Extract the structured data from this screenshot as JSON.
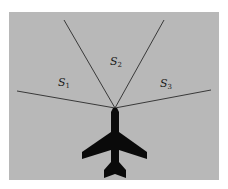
{
  "colors": {
    "background": "#ffffff",
    "field": "#b8b8b8",
    "lines": "#2a2a2a",
    "aircraft": "#0a0a0a",
    "label": "#1a1a1a"
  },
  "field": {
    "x": 9,
    "y": 12,
    "width": 210,
    "height": 168
  },
  "origin": {
    "x": 115,
    "y": 108
  },
  "boundaries": [
    {
      "name": "left-boundary",
      "x": 17,
      "y": 91
    },
    {
      "name": "upper-left-boundary",
      "x": 64,
      "y": 20
    },
    {
      "name": "upper-right-boundary",
      "x": 164,
      "y": 20
    },
    {
      "name": "right-boundary",
      "x": 211,
      "y": 90
    }
  ],
  "sectors": [
    {
      "id": "s1",
      "symbol": "S",
      "subscript": "1",
      "x": 64,
      "y": 83
    },
    {
      "id": "s2",
      "symbol": "S",
      "subscript": "2",
      "x": 116,
      "y": 62
    },
    {
      "id": "s3",
      "symbol": "S",
      "subscript": "3",
      "x": 166,
      "y": 84
    }
  ],
  "aircraft": {
    "icon": "airplane-icon",
    "heading": "up"
  }
}
